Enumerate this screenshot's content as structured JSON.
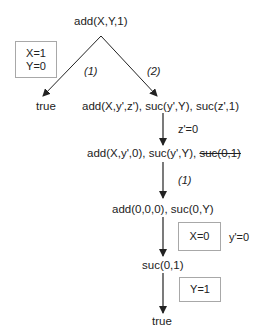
{
  "root": "add(X,Y,1)",
  "substitution_box_1": [
    "X=1",
    "Y=0"
  ],
  "branch_labels": {
    "left": "(1)",
    "right": "(2)"
  },
  "left_leaf": "true",
  "step_1": "add(X,y',z'), suc(y',Y), suc(z',1)",
  "step_1_binding": "z'=0",
  "step_2": {
    "prefix": "add(X,y',0), suc(y',Y), ",
    "struck": "suc(0,1)"
  },
  "step_2_label": "(1)",
  "step_3": "add(0,0,0), suc(0,Y)",
  "substitution_box_2": "X=0",
  "step_3_binding": "y'=0",
  "step_4": "suc(0,1)",
  "substitution_box_3": "Y=1",
  "final_leaf": "true",
  "colors": {
    "text": "#222222",
    "arrow": "#222222",
    "box_border": "#a8a8a8"
  }
}
